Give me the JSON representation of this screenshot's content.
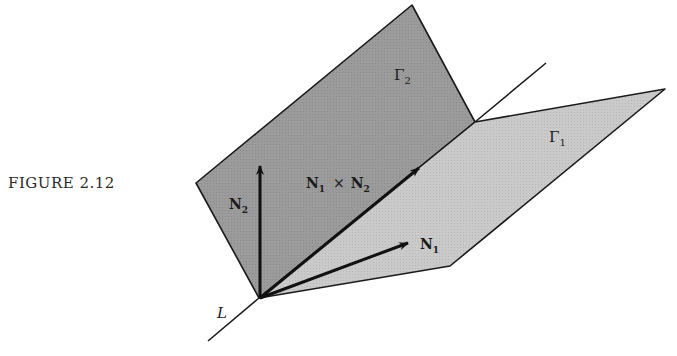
{
  "caption": "FIGURE 2.12",
  "labels": {
    "plane1": "Γ",
    "plane1_sub": "1",
    "plane2": "Γ",
    "plane2_sub": "2",
    "n1": "N",
    "n1_sub": "1",
    "n2": "N",
    "n2_sub": "2",
    "cross_a": "N",
    "cross_a_sub": "1",
    "cross_op": "×",
    "cross_b": "N",
    "cross_b_sub": "2",
    "line": "L"
  },
  "colors": {
    "plane2_fill": "#9a9a9a",
    "plane1_fill": "#c8c8c8",
    "stroke": "#1a1a1a",
    "background": "#ffffff"
  }
}
